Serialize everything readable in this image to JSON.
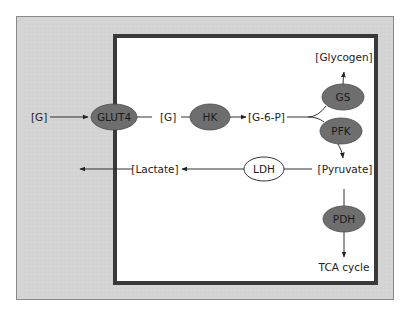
{
  "diagram": {
    "colors": {
      "extracellular_fill": "#d4d4d4",
      "outer_border": "#8a8a8a",
      "cell_fill": "#ffffff",
      "cell_border": "#3a3a3a",
      "enzyme_fill": "#6e6e6e",
      "enzyme_outline_fill": "#ffffff",
      "line": "#333333",
      "text": "#222222"
    },
    "extracellular": {
      "glucose_label": "[G]"
    },
    "transporter": {
      "label": "GLUT4"
    },
    "intracellular": {
      "glucose_label": "[G]",
      "g6p_label": "[G-6-P]",
      "glycogen_label": "[Glycogen]",
      "pyruvate_label": "[Pyruvate]",
      "lactate_label": "[Lactate]",
      "tca_label": "TCA cycle"
    },
    "enzymes": {
      "hk": "HK",
      "gs": "GS",
      "pfk": "PFK",
      "ldh": "LDH",
      "pdh": "PDH"
    }
  }
}
